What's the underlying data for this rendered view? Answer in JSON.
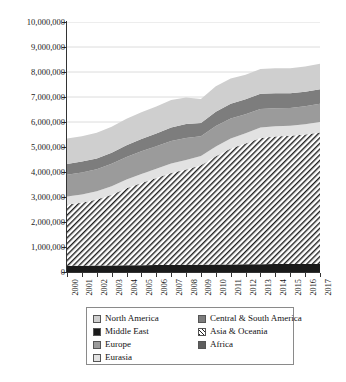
{
  "chart_data": {
    "type": "area",
    "stacked": true,
    "title": "",
    "xlabel": "",
    "ylabel": "",
    "grid": true,
    "legend_position": "bottom",
    "xlim": [
      2000,
      2017
    ],
    "ylim": [
      0,
      10000000
    ],
    "x": [
      2000,
      2001,
      2002,
      2003,
      2004,
      2005,
      2006,
      2007,
      2008,
      2009,
      2010,
      2011,
      2012,
      2013,
      2014,
      2015,
      2016,
      2017
    ],
    "x_tick_labels": [
      "2000",
      "2001",
      "2002",
      "2003",
      "2004",
      "2005",
      "2006",
      "2007",
      "2008",
      "2009",
      "2010",
      "2011",
      "2012",
      "2013",
      "2014",
      "2015",
      "2016",
      "2017"
    ],
    "y_tick_labels": [
      "0",
      "1,000,000",
      "2,000,000",
      "3,000,000",
      "4,000,000",
      "5,000,000",
      "6,000,000",
      "7,000,000",
      "8,000,000",
      "9,000,000",
      "10,000,000"
    ],
    "y_ticks": [
      0,
      1000000,
      2000000,
      3000000,
      4000000,
      5000000,
      6000000,
      7000000,
      8000000,
      9000000,
      10000000
    ],
    "series": [
      {
        "name": "Middle East",
        "color": "#1a1a1a",
        "pattern": "solid",
        "values": [
          250000,
          255000,
          260000,
          265000,
          270000,
          275000,
          280000,
          285000,
          290000,
          295000,
          300000,
          305000,
          310000,
          315000,
          318000,
          320000,
          322000,
          325000
        ]
      },
      {
        "name": "Asia & Oceania",
        "color": "#ffffff",
        "pattern": "hatch",
        "values": [
          2450000,
          2520000,
          2640000,
          2830000,
          3080000,
          3290000,
          3480000,
          3680000,
          3810000,
          3980000,
          4330000,
          4640000,
          4830000,
          5050000,
          5100000,
          5130000,
          5180000,
          5260000
        ]
      },
      {
        "name": "Eurasia",
        "color": "#e2e2e2",
        "pattern": "solid",
        "values": [
          320000,
          325000,
          330000,
          340000,
          350000,
          360000,
          370000,
          380000,
          385000,
          370000,
          390000,
          400000,
          410000,
          415000,
          410000,
          405000,
          410000,
          420000
        ]
      },
      {
        "name": "Europe",
        "color": "#9b9b9b",
        "pattern": "solid",
        "values": [
          870000,
          880000,
          885000,
          895000,
          905000,
          905000,
          905000,
          900000,
          880000,
          790000,
          820000,
          800000,
          760000,
          740000,
          720000,
          710000,
          720000,
          730000
        ]
      },
      {
        "name": "Central & South America",
        "color": "#7d7d7d",
        "pattern": "solid",
        "values": [
          430000,
          440000,
          430000,
          440000,
          465000,
          490000,
          510000,
          540000,
          560000,
          530000,
          570000,
          590000,
          600000,
          610000,
          600000,
          590000,
          580000,
          580000
        ]
      },
      {
        "name": "North America",
        "color": "#cfcfcf",
        "pattern": "solid",
        "values": [
          1020000,
          1010000,
          1030000,
          1040000,
          1060000,
          1070000,
          1080000,
          1100000,
          1060000,
          960000,
          1020000,
          1010000,
          980000,
          990000,
          1000000,
          1000000,
          1010000,
          1020000
        ]
      }
    ],
    "legend_entries": [
      {
        "label": "North America",
        "swatch": "#cfcfcf",
        "pattern": "solid"
      },
      {
        "label": "Central & South America",
        "swatch": "#7d7d7d",
        "pattern": "solid"
      },
      {
        "label": "Middle East",
        "swatch": "#1a1a1a",
        "pattern": "solid"
      },
      {
        "label": "Asia & Oceania",
        "swatch": "#ffffff",
        "pattern": "hatch"
      },
      {
        "label": "Europe",
        "swatch": "#9b9b9b",
        "pattern": "solid"
      },
      {
        "label": "Africa",
        "swatch": "#5e5e5e",
        "pattern": "solid"
      },
      {
        "label": "Eurasia",
        "swatch": "#e2e2e2",
        "pattern": "solid"
      }
    ]
  }
}
